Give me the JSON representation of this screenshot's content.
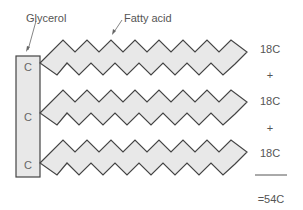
{
  "labels": {
    "glycerol": "Glycerol",
    "fatty_acid": "Fatty acid"
  },
  "glycerol_carbons": [
    "C",
    "C",
    "C"
  ],
  "chains": [
    {
      "length": "18C"
    },
    {
      "length": "18C"
    },
    {
      "length": "18C"
    }
  ],
  "operators": [
    "+",
    "+"
  ],
  "total": "=54C",
  "colors": {
    "fill": "#e8e8e8",
    "stroke": "#444444",
    "text": "#555555"
  }
}
